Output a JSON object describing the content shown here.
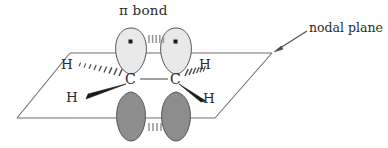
{
  "figure": {
    "title": "π bond",
    "width": 388,
    "height": 148,
    "background": "#ffffff"
  },
  "annotations": {
    "nodal_plane_label": "nodal plane",
    "arrow": {
      "name": "nodal-plane-arrow",
      "from_x": 308,
      "from_y": 32,
      "to_x": 274,
      "to_y": 52
    }
  },
  "atoms": [
    {
      "id": "c-left",
      "label": "C",
      "x": 131,
      "y": 80
    },
    {
      "id": "c-right",
      "label": "C",
      "x": 176,
      "y": 80
    }
  ],
  "hydrogens": [
    {
      "id": "h-upper-left",
      "label": "H",
      "x": 66,
      "y": 65,
      "bond": "hashed-wedge"
    },
    {
      "id": "h-lower-left",
      "label": "H",
      "x": 71,
      "y": 98,
      "bond": "solid-wedge"
    },
    {
      "id": "h-upper-right",
      "label": "H",
      "x": 204,
      "y": 65,
      "bond": "hashed-wedge"
    },
    {
      "id": "h-lower-right",
      "label": "H",
      "x": 208,
      "y": 99,
      "bond": "solid-wedge"
    }
  ],
  "orbitals": {
    "top_lobes": {
      "fill": "#e9e9e9",
      "stroke": "#555555",
      "electron_dot": true,
      "count": 2
    },
    "bottom_lobes": {
      "fill": "#8d8d8d",
      "stroke": "#555555",
      "electron_dot": false,
      "count": 2
    },
    "overlap_dashes": {
      "top_count": 5,
      "bottom_count": 4,
      "color": "#9a9a9a"
    }
  },
  "nodal_plane": {
    "name": "nodal-plane-parallelogram",
    "stroke": "#6f6f6f",
    "points": "70,53 272,53 215,118 17,118"
  },
  "colors": {
    "ink": "#2b2b2b",
    "plane_line": "#6f6f6f",
    "bond": "#8a8a8a",
    "wedge": "#1a1a1a",
    "lobe_light": "#e9e9e9",
    "lobe_dark": "#8d8d8d",
    "lobe_outline": "#555555"
  }
}
